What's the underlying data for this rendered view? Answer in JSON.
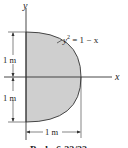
{
  "figure": {
    "axes": {
      "x_label": "x",
      "y_label": "y"
    },
    "curve_label": {
      "lhs": "y",
      "exponent": "2",
      "rhs": " = 1 − x"
    },
    "dimensions": {
      "upper_height": "1 m",
      "lower_height": "1 m",
      "width": "1 m"
    },
    "caption": "Prob. 6-??/??",
    "colors": {
      "fill": "#cfcfcf",
      "stroke": "#333333"
    }
  }
}
